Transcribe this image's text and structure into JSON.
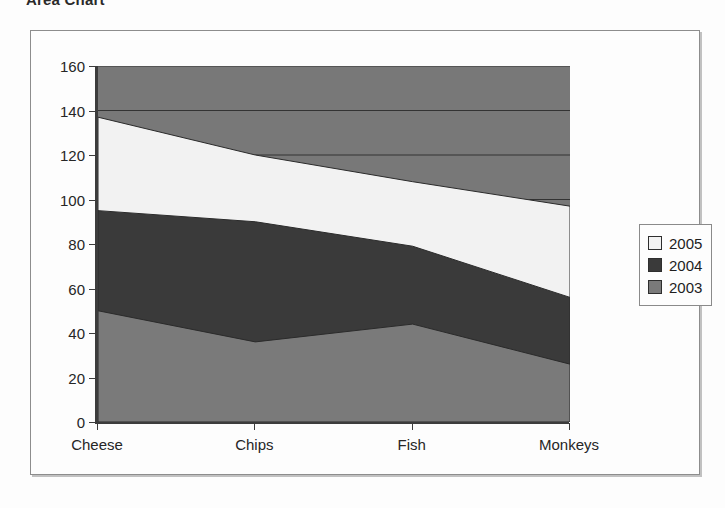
{
  "title": "Area Chart",
  "legend": {
    "position": "right",
    "entries": [
      {
        "label": "2005",
        "color": "#f2f2f2"
      },
      {
        "label": "2004",
        "color": "#3a3a3a"
      },
      {
        "label": "2003",
        "color": "#7a7a7a"
      }
    ]
  },
  "axis": {
    "y_ticks": [
      "160",
      "140",
      "120",
      "100",
      "80",
      "60",
      "40",
      "20",
      "0"
    ],
    "x_ticks": [
      "Cheese",
      "Chips",
      "Fish",
      "Monkeys"
    ]
  },
  "chart_data": {
    "type": "area",
    "stacked": true,
    "title": "Area Chart",
    "xlabel": "",
    "ylabel": "",
    "categories": [
      "Cheese",
      "Chips",
      "Fish",
      "Monkeys"
    ],
    "series": [
      {
        "name": "2003",
        "color": "#7a7a7a",
        "values": [
          50,
          36,
          44,
          26
        ]
      },
      {
        "name": "2004",
        "color": "#3a3a3a",
        "values": [
          45,
          54,
          35,
          30
        ]
      },
      {
        "name": "2005",
        "color": "#f2f2f2",
        "values": [
          42,
          30,
          29,
          41
        ]
      }
    ],
    "cumulative": {
      "2003": [
        50,
        36,
        44,
        26
      ],
      "2003+2004": [
        95,
        90,
        79,
        56
      ],
      "total": [
        137,
        120,
        108,
        97
      ]
    },
    "ylim": [
      0,
      160
    ],
    "ytick_step": 20,
    "grid": true,
    "grid_lines": [
      160,
      140,
      120,
      100
    ],
    "plot_background": "#787878",
    "legend_position": "right"
  }
}
